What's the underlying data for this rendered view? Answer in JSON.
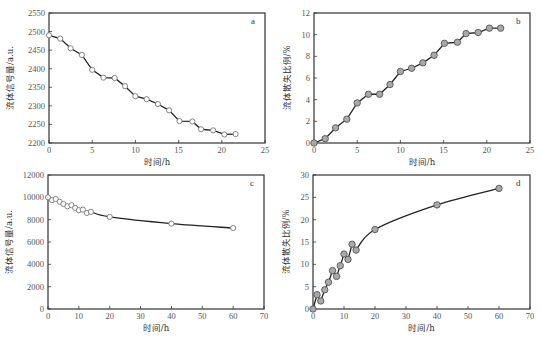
{
  "chart_data": [
    {
      "id": "a",
      "type": "line",
      "panel_label": "a",
      "xlabel": "时间/h",
      "ylabel": "流体信号量/a.u.",
      "xlim": [
        0,
        25
      ],
      "ylim": [
        2200,
        2550
      ],
      "xticks": [
        0,
        5,
        10,
        15,
        20,
        25
      ],
      "yticks": [
        2200,
        2250,
        2300,
        2350,
        2400,
        2450,
        2500,
        2550
      ],
      "grid": false,
      "marker": "open-circle",
      "frame": {
        "left": 49,
        "top": 13,
        "right": 265,
        "bottom": 143
      },
      "series": [
        {
          "name": "a",
          "x": [
            0,
            1.3,
            2.5,
            3.8,
            5.0,
            6.3,
            7.6,
            8.8,
            10.0,
            11.3,
            12.6,
            13.9,
            15.1,
            16.6,
            17.6,
            19.0,
            20.3,
            21.6
          ],
          "y": [
            2490,
            2481,
            2455,
            2437,
            2397,
            2376,
            2375,
            2353,
            2326,
            2318,
            2305,
            2288,
            2259,
            2258,
            2237,
            2234,
            2223,
            2224
          ]
        }
      ]
    },
    {
      "id": "b",
      "type": "line",
      "panel_label": "b",
      "xlabel": "时间/h",
      "ylabel": "流体散失比例/%",
      "xlim": [
        0,
        25
      ],
      "ylim": [
        0,
        12
      ],
      "xticks": [
        0,
        5,
        10,
        15,
        20,
        25
      ],
      "yticks": [
        0,
        2,
        4,
        6,
        8,
        10,
        12
      ],
      "grid": false,
      "marker": "filled-circle",
      "frame": {
        "left": 314,
        "top": 13,
        "right": 530,
        "bottom": 143
      },
      "series": [
        {
          "name": "b",
          "x": [
            0,
            1.3,
            2.5,
            3.8,
            5.0,
            6.3,
            7.6,
            8.8,
            10.0,
            11.3,
            12.6,
            13.9,
            15.1,
            16.6,
            17.6,
            19.0,
            20.3,
            21.6
          ],
          "y": [
            0,
            0.4,
            1.4,
            2.2,
            3.7,
            4.5,
            4.5,
            5.4,
            6.6,
            6.9,
            7.4,
            8.1,
            9.2,
            9.3,
            10.1,
            10.2,
            10.6,
            10.6
          ]
        }
      ]
    },
    {
      "id": "c",
      "type": "line",
      "panel_label": "c",
      "xlabel": "时间/h",
      "ylabel": "流体信号量/a.u.",
      "xlim": [
        0,
        70
      ],
      "ylim": [
        0,
        12000
      ],
      "xticks": [
        0,
        10,
        20,
        30,
        40,
        50,
        60,
        70
      ],
      "yticks": [
        0,
        2000,
        4000,
        6000,
        8000,
        10000,
        12000
      ],
      "grid": false,
      "marker": "open-circle",
      "frame": {
        "left": 48,
        "top": 175,
        "right": 264,
        "bottom": 309
      },
      "series": [
        {
          "name": "c",
          "x": [
            0,
            1.3,
            2.5,
            3.8,
            5.0,
            6.3,
            7.6,
            8.8,
            10.0,
            11.3,
            12.6,
            13.9,
            20,
            40,
            60
          ],
          "y": [
            10000,
            9750,
            9850,
            9600,
            9400,
            9200,
            9300,
            9050,
            8850,
            8900,
            8600,
            8700,
            8250,
            7650,
            7250
          ]
        }
      ]
    },
    {
      "id": "d",
      "type": "line",
      "panel_label": "d",
      "xlabel": "时间/h",
      "ylabel": "流体散失比例/%",
      "xlim": [
        0,
        70
      ],
      "ylim": [
        0,
        30
      ],
      "xticks": [
        0,
        10,
        20,
        30,
        40,
        50,
        60,
        70
      ],
      "yticks": [
        0,
        5,
        10,
        15,
        20,
        25,
        30
      ],
      "grid": false,
      "marker": "filled-circle",
      "frame": {
        "left": 313,
        "top": 175,
        "right": 530,
        "bottom": 309
      },
      "series": [
        {
          "name": "d",
          "x": [
            0,
            1.3,
            2.5,
            3.8,
            5.0,
            6.3,
            7.6,
            8.8,
            10.0,
            11.3,
            12.6,
            13.9,
            20,
            40,
            60
          ],
          "y": [
            0,
            3.2,
            1.8,
            4.3,
            6.0,
            8.6,
            7.3,
            9.7,
            12.3,
            11.1,
            14.5,
            13.2,
            17.8,
            23.3,
            27.0
          ]
        }
      ]
    }
  ],
  "colors": {
    "line": "#222222",
    "frame": "#333333",
    "open_marker_fill": "#ffffff",
    "open_marker_stroke": "#777777",
    "filled_marker_fill": "#a9a9a9",
    "filled_marker_stroke": "#555555",
    "tick_text": "#555555"
  }
}
